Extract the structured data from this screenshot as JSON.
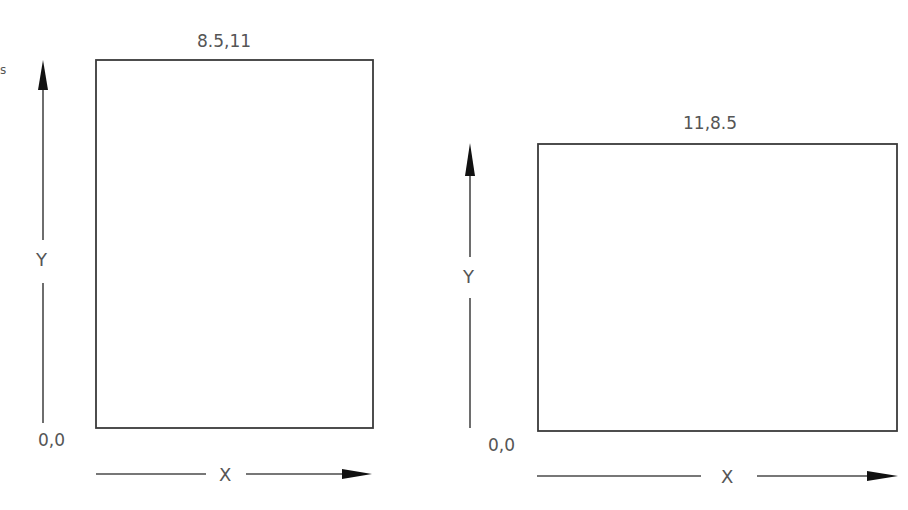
{
  "diagram": {
    "stray_mark": "s",
    "portrait": {
      "corner_top_right_label": "8.5,11",
      "origin_label": "0,0",
      "y_axis_label": "Y",
      "x_axis_label": "X"
    },
    "landscape": {
      "corner_top_right_label": "11,8.5",
      "origin_label": "0,0",
      "y_axis_label": "Y",
      "x_axis_label": "X"
    },
    "colors": {
      "stroke": "#3a3a3a",
      "text": "#555555",
      "arrowhead": "#111111",
      "background": "#ffffff"
    }
  }
}
